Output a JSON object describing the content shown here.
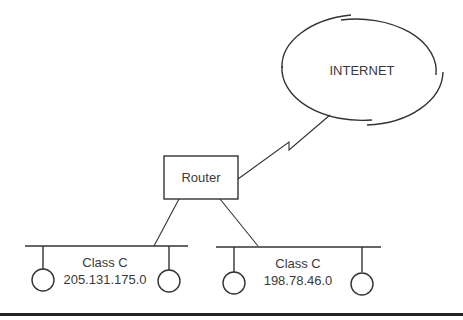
{
  "diagram": {
    "internet": {
      "label": "INTERNET"
    },
    "router": {
      "label": "Router"
    },
    "networks": [
      {
        "class_label": "Class C",
        "address": "205.131.175.0"
      },
      {
        "class_label": "Class C",
        "address": "198.78.46.0"
      }
    ],
    "colors": {
      "line": "#333333",
      "text": "#3a3a3a",
      "background": "#ffffff"
    }
  }
}
